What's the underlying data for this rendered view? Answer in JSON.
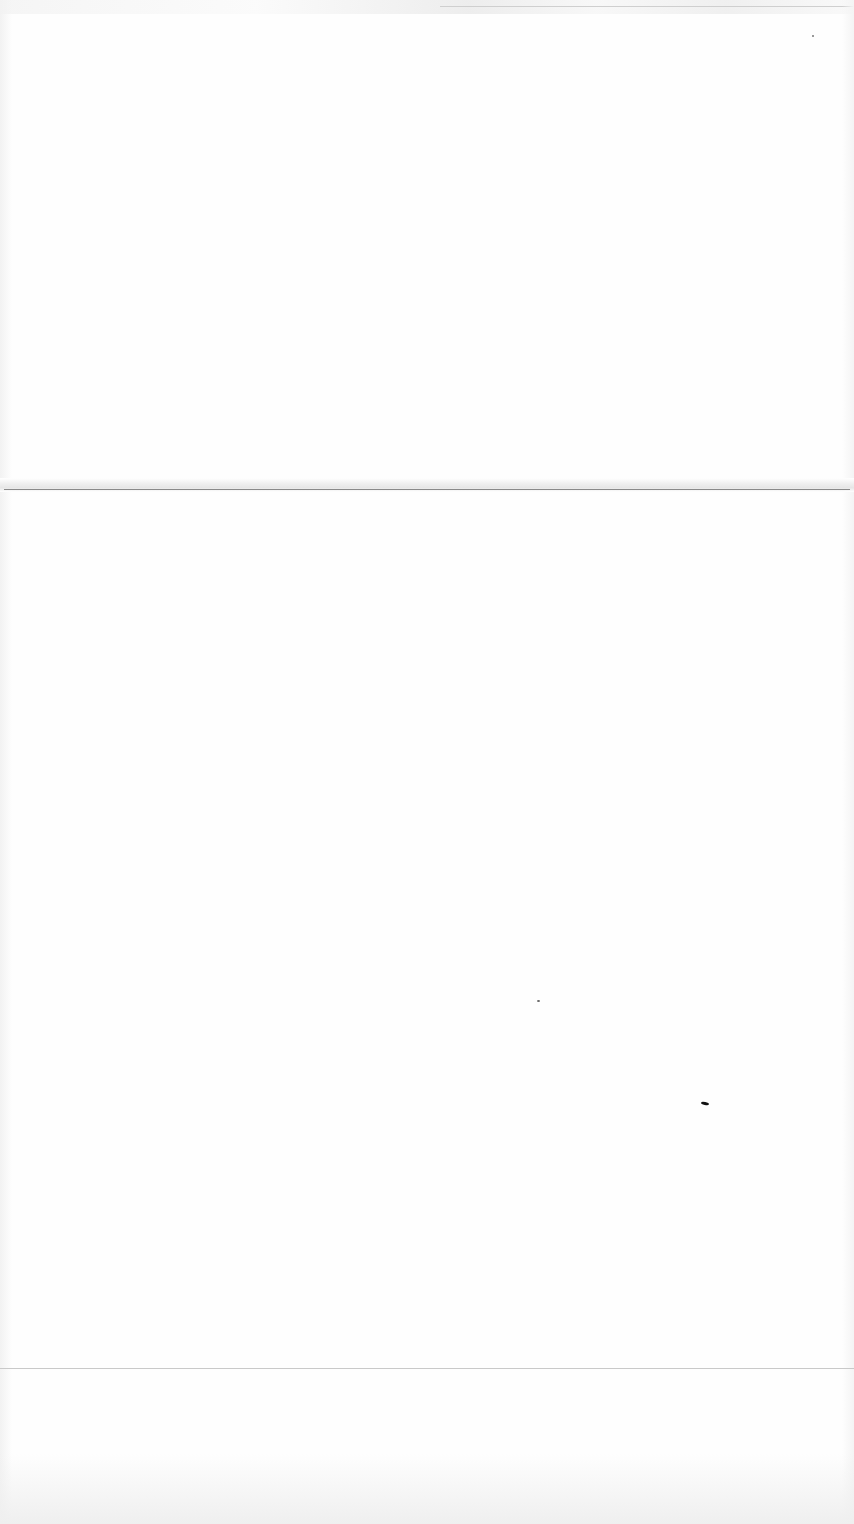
{
  "document": {
    "type": "blank scanned page",
    "text_content": []
  }
}
